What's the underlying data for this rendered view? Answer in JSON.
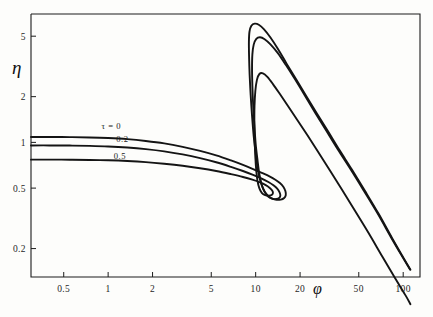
{
  "figure": {
    "background_color": "#fdfdfb",
    "ink_color": "#141414"
  },
  "chart_data": {
    "type": "line",
    "title": "",
    "subtitle": "",
    "xlabel": "φ",
    "ylabel": "η",
    "xscale": "log",
    "yscale": "log",
    "xlim": [
      0.3,
      130
    ],
    "ylim": [
      0.13,
      7.0
    ],
    "grid": false,
    "legend_position": "inline-curve-labels",
    "xticks": [
      0.5,
      1,
      2,
      5,
      10,
      20,
      50,
      100
    ],
    "xticklabels": [
      "0.5",
      "1",
      "2",
      "5",
      "10",
      "20",
      "50",
      "100"
    ],
    "yticks": [
      0.2,
      0.5,
      1,
      2,
      5
    ],
    "yticklabels": [
      "0.2",
      "0.5",
      "1",
      "2",
      "5"
    ],
    "annotations": [
      {
        "text": "τ = 0",
        "x": 1.05,
        "y": 1.22,
        "series": "tau0"
      },
      {
        "text": "0.2",
        "x": 1.25,
        "y": 1.0,
        "series": "tau02"
      },
      {
        "text": "0.5",
        "x": 1.2,
        "y": 0.78,
        "series": "tau05"
      }
    ],
    "series": [
      {
        "name": "τ = 0",
        "label": "τ = 0",
        "color": "#141414",
        "points": [
          [
            0.3,
            1.085
          ],
          [
            0.4,
            1.085
          ],
          [
            0.55,
            1.083
          ],
          [
            0.75,
            1.078
          ],
          [
            1.0,
            1.068
          ],
          [
            1.35,
            1.05
          ],
          [
            1.8,
            1.022
          ],
          [
            2.4,
            0.985
          ],
          [
            3.2,
            0.935
          ],
          [
            4.2,
            0.88
          ],
          [
            5.4,
            0.822
          ],
          [
            6.8,
            0.762
          ],
          [
            8.2,
            0.712
          ],
          [
            9.6,
            0.668
          ],
          [
            11.0,
            0.63
          ],
          [
            12.4,
            0.597
          ],
          [
            13.6,
            0.568
          ],
          [
            14.6,
            0.54
          ],
          [
            15.4,
            0.51
          ],
          [
            15.9,
            0.478
          ],
          [
            16.0,
            0.45
          ],
          [
            15.6,
            0.43
          ],
          [
            14.8,
            0.42
          ],
          [
            13.6,
            0.42
          ],
          [
            12.6,
            0.432
          ],
          [
            11.8,
            0.458
          ],
          [
            11.2,
            0.5
          ],
          [
            10.7,
            0.57
          ],
          [
            10.3,
            0.68
          ],
          [
            10.0,
            0.85
          ],
          [
            9.7,
            1.1
          ],
          [
            9.45,
            1.5
          ],
          [
            9.25,
            2.05
          ],
          [
            9.1,
            2.8
          ],
          [
            9.02,
            3.7
          ],
          [
            9.0,
            4.6
          ],
          [
            9.08,
            5.35
          ],
          [
            9.35,
            5.85
          ],
          [
            9.85,
            6.05
          ],
          [
            10.5,
            5.95
          ],
          [
            11.4,
            5.55
          ],
          [
            12.6,
            4.9
          ],
          [
            14.2,
            4.1
          ],
          [
            16.2,
            3.3
          ],
          [
            18.8,
            2.6
          ],
          [
            22.0,
            2.02
          ],
          [
            26.0,
            1.55
          ],
          [
            31.0,
            1.18
          ],
          [
            37.0,
            0.89
          ],
          [
            45.0,
            0.66
          ],
          [
            55.0,
            0.48
          ],
          [
            68.0,
            0.34
          ],
          [
            84.0,
            0.235
          ],
          [
            100.0,
            0.175
          ],
          [
            112.0,
            0.145
          ]
        ]
      },
      {
        "name": "0.2",
        "label": "0.2",
        "color": "#141414",
        "points": [
          [
            0.3,
            0.955
          ],
          [
            0.4,
            0.955
          ],
          [
            0.55,
            0.953
          ],
          [
            0.75,
            0.948
          ],
          [
            1.0,
            0.94
          ],
          [
            1.35,
            0.925
          ],
          [
            1.8,
            0.903
          ],
          [
            2.4,
            0.873
          ],
          [
            3.2,
            0.833
          ],
          [
            4.2,
            0.788
          ],
          [
            5.4,
            0.74
          ],
          [
            6.8,
            0.69
          ],
          [
            8.2,
            0.648
          ],
          [
            9.6,
            0.611
          ],
          [
            11.0,
            0.578
          ],
          [
            12.2,
            0.549
          ],
          [
            13.2,
            0.522
          ],
          [
            14.0,
            0.496
          ],
          [
            14.5,
            0.47
          ],
          [
            14.7,
            0.448
          ],
          [
            14.5,
            0.432
          ],
          [
            13.8,
            0.424
          ],
          [
            12.9,
            0.426
          ],
          [
            12.1,
            0.442
          ],
          [
            11.5,
            0.472
          ],
          [
            11.0,
            0.525
          ],
          [
            10.6,
            0.615
          ],
          [
            10.3,
            0.76
          ],
          [
            10.0,
            0.98
          ],
          [
            9.8,
            1.3
          ],
          [
            9.62,
            1.75
          ],
          [
            9.5,
            2.35
          ],
          [
            9.45,
            3.05
          ],
          [
            9.5,
            3.8
          ],
          [
            9.7,
            4.4
          ],
          [
            10.1,
            4.8
          ],
          [
            10.7,
            4.92
          ],
          [
            11.5,
            4.78
          ],
          [
            12.6,
            4.42
          ],
          [
            14.1,
            3.88
          ],
          [
            16.0,
            3.24
          ],
          [
            18.4,
            2.62
          ],
          [
            21.4,
            2.06
          ],
          [
            25.2,
            1.58
          ],
          [
            30.0,
            1.2
          ],
          [
            36.0,
            0.9
          ],
          [
            44.0,
            0.665
          ],
          [
            54.0,
            0.482
          ],
          [
            67.0,
            0.341
          ],
          [
            83.0,
            0.236
          ],
          [
            99.0,
            0.176
          ],
          [
            111.0,
            0.146
          ]
        ]
      },
      {
        "name": "0.5",
        "label": "0.5",
        "color": "#141414",
        "points": [
          [
            0.3,
            0.77
          ],
          [
            0.4,
            0.77
          ],
          [
            0.55,
            0.769
          ],
          [
            0.75,
            0.766
          ],
          [
            1.0,
            0.762
          ],
          [
            1.35,
            0.754
          ],
          [
            1.8,
            0.742
          ],
          [
            2.4,
            0.724
          ],
          [
            3.2,
            0.702
          ],
          [
            4.2,
            0.676
          ],
          [
            5.4,
            0.648
          ],
          [
            6.8,
            0.618
          ],
          [
            8.2,
            0.592
          ],
          [
            9.5,
            0.568
          ],
          [
            10.7,
            0.545
          ],
          [
            11.7,
            0.523
          ],
          [
            12.4,
            0.503
          ],
          [
            12.9,
            0.484
          ],
          [
            13.1,
            0.466
          ],
          [
            12.9,
            0.452
          ],
          [
            12.3,
            0.446
          ],
          [
            11.6,
            0.45
          ],
          [
            11.0,
            0.466
          ],
          [
            10.6,
            0.498
          ],
          [
            10.3,
            0.555
          ],
          [
            10.1,
            0.65
          ],
          [
            9.95,
            0.8
          ],
          [
            9.85,
            1.02
          ],
          [
            9.8,
            1.33
          ],
          [
            9.82,
            1.73
          ],
          [
            9.95,
            2.18
          ],
          [
            10.2,
            2.58
          ],
          [
            10.6,
            2.82
          ],
          [
            11.2,
            2.85
          ],
          [
            12.0,
            2.7
          ],
          [
            13.1,
            2.42
          ],
          [
            14.6,
            2.08
          ],
          [
            16.6,
            1.73
          ],
          [
            19.2,
            1.4
          ],
          [
            22.5,
            1.11
          ],
          [
            26.6,
            0.862
          ],
          [
            31.8,
            0.655
          ],
          [
            38.5,
            0.487
          ],
          [
            47.0,
            0.356
          ],
          [
            58.0,
            0.255
          ],
          [
            72.0,
            0.178
          ],
          [
            88.0,
            0.128
          ],
          [
            104.0,
            0.098
          ],
          [
            112.0,
            0.086
          ]
        ]
      }
    ]
  },
  "axes": {
    "x_axis_name": "φ",
    "y_axis_name": "η"
  }
}
